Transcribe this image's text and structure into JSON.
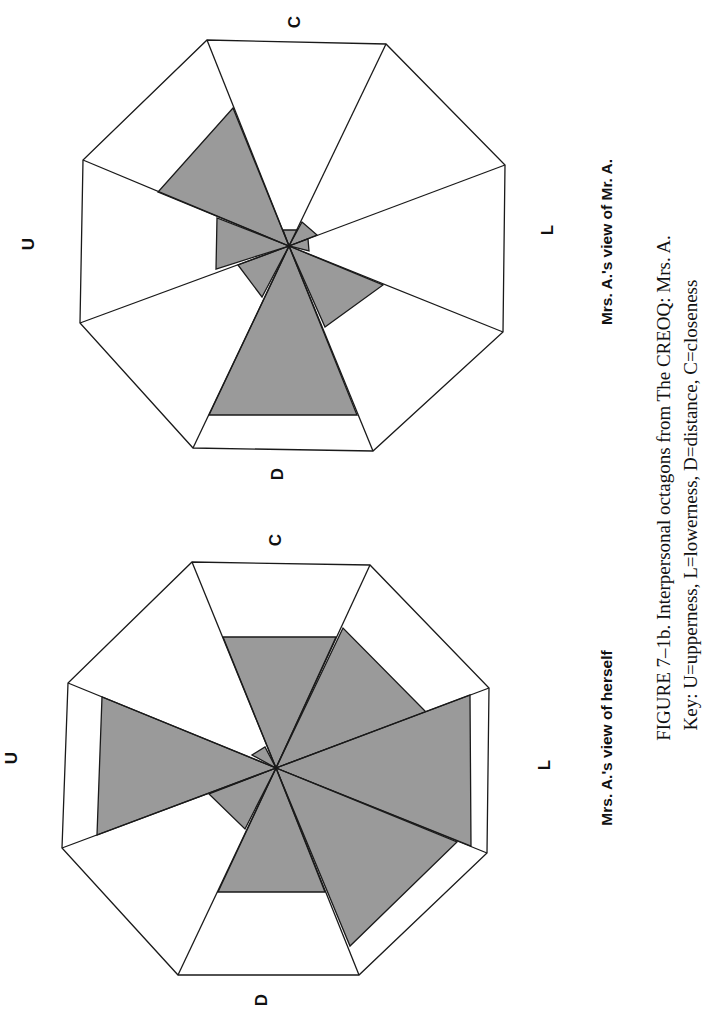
{
  "figure": {
    "caption_line1": "FIGURE 7–1b.  Interpersonal octagons from The CREOQ: Mrs. A.",
    "caption_line2": "Key: U=upperness, L=lowerness, D=distance, C=closeness",
    "shade_color": "#9a9a9a",
    "line_color": "#1a1a1a"
  },
  "octagons": [
    {
      "id": "mr-a",
      "subtitle": "Mrs. A.'s view of Mr. A.",
      "labels": {
        "U": "U",
        "C": "C",
        "D": "D",
        "L": "L"
      },
      "center": [
        289,
        246
      ],
      "vertices": [
        [
          207,
          40
        ],
        [
          386,
          44
        ],
        [
          505,
          165
        ],
        [
          503,
          332
        ],
        [
          373,
          451
        ],
        [
          193,
          448
        ],
        [
          80,
          323
        ],
        [
          83,
          160
        ]
      ],
      "shaded_sectors": [
        [
          [
            283,
            230
          ],
          [
            298,
            230
          ]
        ],
        [
          [
            302,
            222
          ],
          [
            317,
            235
          ]
        ],
        [
          [
            308,
            239
          ],
          [
            309,
            251
          ]
        ],
        [
          [
            383,
            285
          ],
          [
            325,
            327
          ]
        ],
        [
          [
            357,
            415
          ],
          [
            209,
            415
          ]
        ],
        [
          [
            262,
            297
          ],
          [
            238,
            265
          ]
        ],
        [
          [
            216,
            269
          ],
          [
            217,
            218
          ]
        ],
        [
          [
            158,
            192
          ],
          [
            233,
            108
          ]
        ]
      ]
    },
    {
      "id": "mrs-a",
      "subtitle": "Mrs. A.'s view of herself",
      "labels": {
        "U": "U",
        "C": "C",
        "D": "D",
        "L": "L"
      },
      "center": [
        276,
        768
      ],
      "vertices": [
        [
          192,
          562
        ],
        [
          370,
          565
        ],
        [
          489,
          688
        ],
        [
          487,
          853
        ],
        [
          359,
          975
        ],
        [
          178,
          975
        ],
        [
          62,
          848
        ],
        [
          68,
          683
        ]
      ],
      "shaded_sectors": [
        [
          [
            223,
            637
          ],
          [
            336,
            637
          ]
        ],
        [
          [
            343,
            628
          ],
          [
            426,
            712
          ]
        ],
        [
          [
            470,
            695
          ],
          [
            471,
            846
          ]
        ],
        [
          [
            457,
            842
          ],
          [
            350,
            946
          ]
        ],
        [
          [
            325,
            892
          ],
          [
            218,
            892
          ]
        ],
        [
          [
            245,
            829
          ],
          [
            209,
            794
          ]
        ],
        [
          [
            97,
            835
          ],
          [
            102,
            697
          ]
        ],
        [
          [
            252,
            755
          ],
          [
            265,
            747
          ]
        ]
      ]
    }
  ],
  "chart_data": {
    "type": "radar-octagon",
    "title": "FIGURE 7–1b. Interpersonal octagons from The CREOQ: Mrs. A.",
    "key": {
      "U": "upperness",
      "L": "lowerness",
      "D": "distance",
      "C": "closeness"
    },
    "sectors_order": [
      "C",
      "C-L",
      "L",
      "L-D",
      "D",
      "D-U",
      "U",
      "U-C"
    ],
    "charts": [
      {
        "name": "Mrs. A.'s view of Mr. A.",
        "relative_scores": [
          0.08,
          0.15,
          0.1,
          0.45,
          0.8,
          0.25,
          0.35,
          0.6
        ]
      },
      {
        "name": "Mrs. A.'s view of herself",
        "relative_scores": [
          0.6,
          0.6,
          0.85,
          0.75,
          0.6,
          0.3,
          0.82,
          0.1
        ]
      }
    ]
  }
}
